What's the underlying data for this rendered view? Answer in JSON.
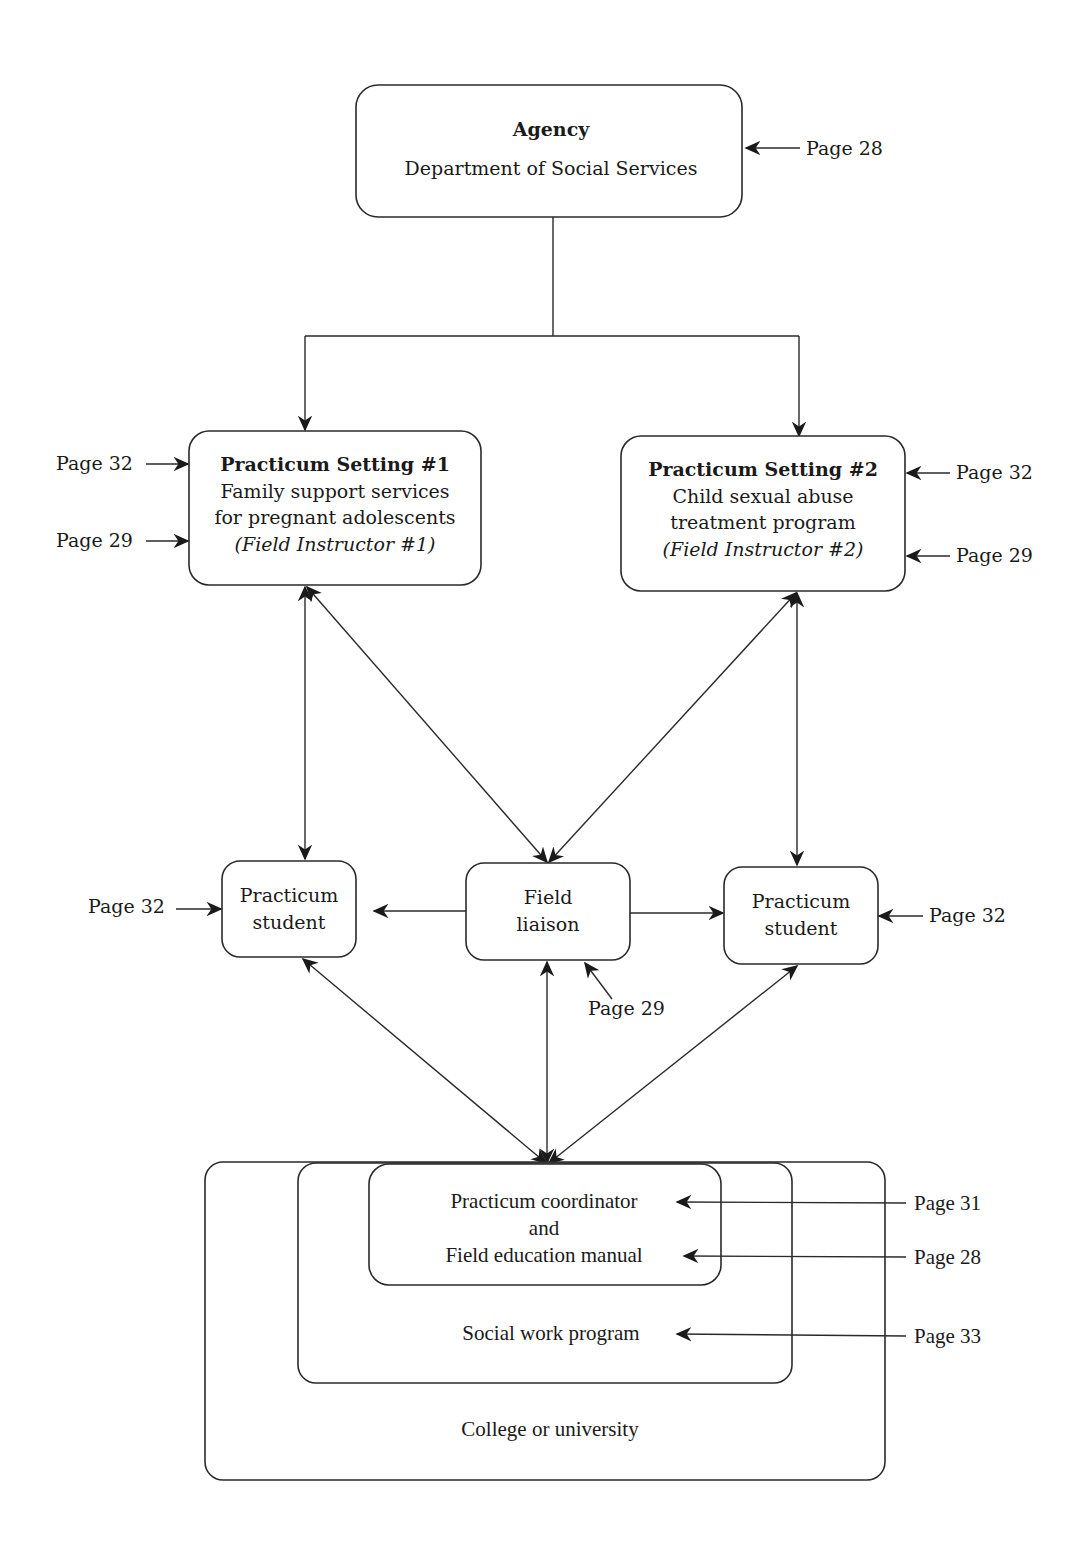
{
  "diagram": {
    "agency": {
      "title": "Agency",
      "subtitle": "Department of Social Services",
      "page_ref": "Page 28"
    },
    "setting1": {
      "title": "Practicum Setting #1",
      "line1": "Family support services",
      "line2": "for pregnant adolescents",
      "instructor": "(Field Instructor #1)",
      "page_ref_top": "Page 32",
      "page_ref_bottom": "Page 29"
    },
    "setting2": {
      "title": "Practicum Setting #2",
      "line1": "Child sexual abuse",
      "line2": "treatment program",
      "instructor": "(Field Instructor #2)",
      "page_ref_top": "Page 32",
      "page_ref_bottom": "Page 29"
    },
    "student1": {
      "line1": "Practicum",
      "line2": "student",
      "page_ref": "Page 32"
    },
    "liaison": {
      "line1": "Field",
      "line2": "liaison",
      "page_ref": "Page 29"
    },
    "student2": {
      "line1": "Practicum",
      "line2": "student",
      "page_ref": "Page 32"
    },
    "coordinator": {
      "line1": "Practicum coordinator",
      "line2": "and",
      "line3": "Field education manual",
      "page_ref_coordinator": "Page 31",
      "page_ref_manual": "Page 28"
    },
    "program": {
      "label": "Social work program",
      "page_ref": "Page 33"
    },
    "college": {
      "label": "College or university"
    }
  }
}
